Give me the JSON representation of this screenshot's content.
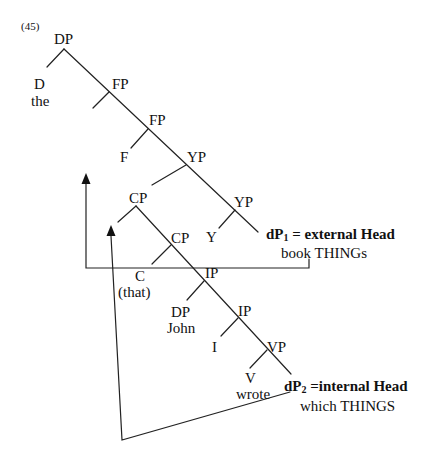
{
  "example_number": "(45)",
  "nodes": {
    "dp_root": "DP",
    "d": "D",
    "d_word": "the",
    "fp1": "FP",
    "fp2": "FP",
    "f": "F",
    "yp1": "YP",
    "cp1": "CP",
    "yp2": "YP",
    "y": "Y",
    "cp2": "CP",
    "c": "C",
    "c_word": "(that)",
    "ip1": "IP",
    "dp_john": "DP",
    "dp_john_word": "John",
    "ip2": "IP",
    "i": "I",
    "vp": "VP",
    "v": "V",
    "v_word": "wrote"
  },
  "heads": {
    "external": {
      "dp": "dP",
      "sub": "1",
      "label": " = external Head",
      "gloss": "book THINGs"
    },
    "internal": {
      "dp": "dP",
      "sub": "2",
      "label": " =internal Head",
      "gloss": "which THINGS"
    }
  },
  "colors": {
    "line": "#222222",
    "text": "#111111",
    "background": "#ffffff"
  }
}
